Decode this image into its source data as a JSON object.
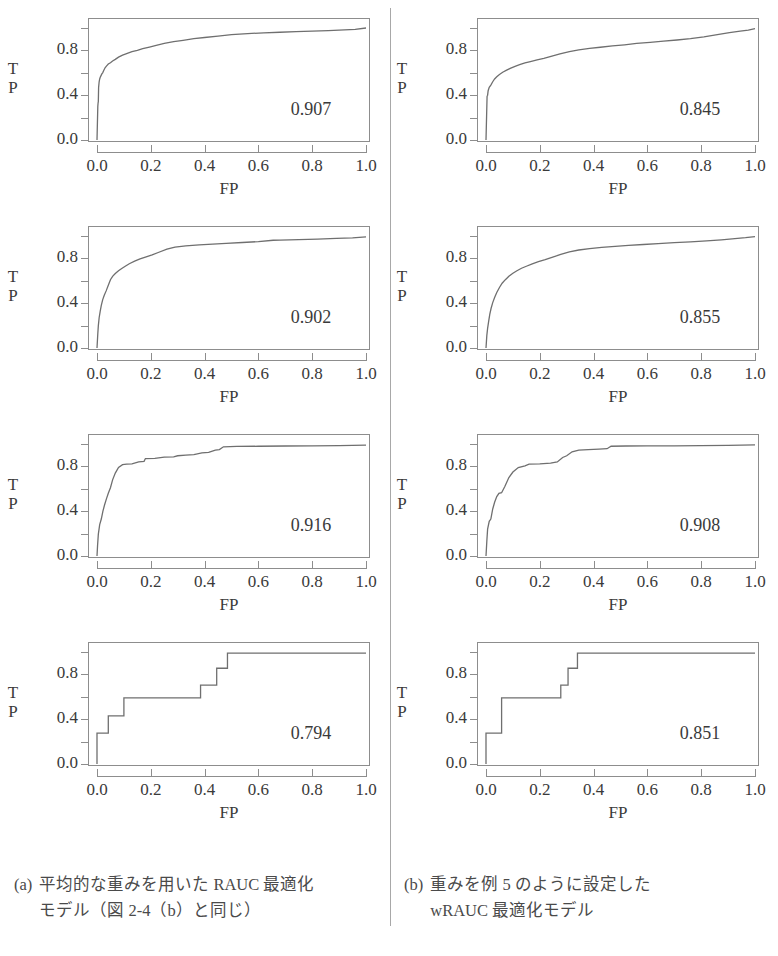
{
  "figure": {
    "axis_labels": {
      "y": [
        "T",
        "P"
      ],
      "x": "FP"
    },
    "y_ticks": [
      "0.0",
      "0.4",
      "0.8"
    ],
    "x_ticks": [
      "0.0",
      "0.2",
      "0.4",
      "0.6",
      "0.8",
      "1.0"
    ],
    "line_color": "#6f6f6f",
    "box_color": "#8d8d8d",
    "text_color": "#3a3a3a"
  },
  "panels": [
    {
      "id": "panel-a1",
      "column": "a",
      "row": 1,
      "auc": "0.907"
    },
    {
      "id": "panel-b1",
      "column": "b",
      "row": 1,
      "auc": "0.845"
    },
    {
      "id": "panel-a2",
      "column": "a",
      "row": 2,
      "auc": "0.902"
    },
    {
      "id": "panel-b2",
      "column": "b",
      "row": 2,
      "auc": "0.855"
    },
    {
      "id": "panel-a3",
      "column": "a",
      "row": 3,
      "auc": "0.916"
    },
    {
      "id": "panel-b3",
      "column": "b",
      "row": 3,
      "auc": "0.908"
    },
    {
      "id": "panel-a4",
      "column": "a",
      "row": 4,
      "auc": "0.794"
    },
    {
      "id": "panel-b4",
      "column": "b",
      "row": 4,
      "auc": "0.851"
    }
  ],
  "captions": {
    "a": {
      "tag": "(a)",
      "line1": "平均的な重みを用いた RAUC 最適化",
      "line2": "モデル（図 2-4（b）と同じ）"
    },
    "b": {
      "tag": "(b)",
      "line1": "重みを例 5 のように設定した",
      "line2": "wRAUC 最適化モデル"
    }
  },
  "chart_data": [
    {
      "type": "line",
      "title": "ROC curve (a) row 1",
      "xlabel": "FP",
      "ylabel": "TP",
      "xlim": [
        0,
        1
      ],
      "ylim": [
        0,
        1
      ],
      "xticks": [
        0.0,
        0.2,
        0.4,
        0.6,
        0.8,
        1.0
      ],
      "yticks": [
        0.0,
        0.4,
        0.8
      ],
      "grid": false,
      "annotations": [
        {
          "text": "0.907",
          "x": 0.78,
          "y": 0.22
        }
      ],
      "x": [
        0.0,
        0.003,
        0.004,
        0.005,
        0.006,
        0.008,
        0.01,
        0.012,
        0.015,
        0.018,
        0.021,
        0.025,
        0.03,
        0.035,
        0.042,
        0.05,
        0.058,
        0.068,
        0.08,
        0.095,
        0.11,
        0.13,
        0.15,
        0.17,
        0.195,
        0.22,
        0.25,
        0.285,
        0.32,
        0.36,
        0.4,
        0.45,
        0.5,
        0.56,
        0.62,
        0.68,
        0.74,
        0.8,
        0.86,
        0.92,
        0.96,
        1.0
      ],
      "y": [
        0.0,
        0.3,
        0.33,
        0.345,
        0.47,
        0.52,
        0.545,
        0.56,
        0.575,
        0.59,
        0.6,
        0.62,
        0.645,
        0.66,
        0.678,
        0.69,
        0.705,
        0.72,
        0.74,
        0.758,
        0.772,
        0.788,
        0.8,
        0.815,
        0.83,
        0.845,
        0.862,
        0.878,
        0.89,
        0.905,
        0.915,
        0.928,
        0.94,
        0.95,
        0.957,
        0.962,
        0.968,
        0.972,
        0.977,
        0.983,
        0.988,
        1.0
      ]
    },
    {
      "type": "line",
      "title": "ROC curve (b) row 1",
      "xlabel": "FP",
      "ylabel": "TP",
      "xlim": [
        0,
        1
      ],
      "ylim": [
        0,
        1
      ],
      "xticks": [
        0.0,
        0.2,
        0.4,
        0.6,
        0.8,
        1.0
      ],
      "yticks": [
        0.0,
        0.4,
        0.8
      ],
      "grid": false,
      "annotations": [
        {
          "text": "0.845",
          "x": 0.78,
          "y": 0.22
        }
      ],
      "x": [
        0.0,
        0.004,
        0.006,
        0.008,
        0.012,
        0.018,
        0.025,
        0.032,
        0.04,
        0.05,
        0.062,
        0.075,
        0.09,
        0.108,
        0.125,
        0.145,
        0.165,
        0.19,
        0.215,
        0.245,
        0.275,
        0.31,
        0.345,
        0.385,
        0.425,
        0.47,
        0.515,
        0.56,
        0.61,
        0.66,
        0.71,
        0.76,
        0.81,
        0.86,
        0.905,
        0.945,
        0.975,
        1.0
      ],
      "y": [
        0.0,
        0.39,
        0.4,
        0.44,
        0.47,
        0.49,
        0.52,
        0.545,
        0.565,
        0.585,
        0.605,
        0.622,
        0.64,
        0.658,
        0.672,
        0.688,
        0.7,
        0.715,
        0.728,
        0.748,
        0.768,
        0.79,
        0.805,
        0.818,
        0.828,
        0.84,
        0.85,
        0.862,
        0.872,
        0.882,
        0.893,
        0.905,
        0.92,
        0.94,
        0.958,
        0.972,
        0.982,
        0.995
      ]
    },
    {
      "type": "line",
      "title": "ROC curve (a) row 2",
      "xlabel": "FP",
      "ylabel": "TP",
      "xlim": [
        0,
        1
      ],
      "ylim": [
        0,
        1
      ],
      "xticks": [
        0.0,
        0.2,
        0.4,
        0.6,
        0.8,
        1.0
      ],
      "yticks": [
        0.0,
        0.4,
        0.8
      ],
      "grid": false,
      "annotations": [
        {
          "text": "0.902",
          "x": 0.78,
          "y": 0.22
        }
      ],
      "x": [
        0.0,
        0.003,
        0.005,
        0.008,
        0.012,
        0.016,
        0.021,
        0.027,
        0.034,
        0.042,
        0.05,
        0.058,
        0.068,
        0.08,
        0.092,
        0.105,
        0.12,
        0.14,
        0.16,
        0.18,
        0.205,
        0.23,
        0.26,
        0.29,
        0.33,
        0.38,
        0.43,
        0.48,
        0.54,
        0.6,
        0.655,
        0.68,
        0.75,
        0.82,
        0.89,
        0.95,
        1.0
      ],
      "y": [
        0.0,
        0.13,
        0.2,
        0.27,
        0.33,
        0.38,
        0.43,
        0.47,
        0.51,
        0.56,
        0.61,
        0.64,
        0.665,
        0.69,
        0.71,
        0.73,
        0.752,
        0.775,
        0.795,
        0.812,
        0.832,
        0.855,
        0.882,
        0.9,
        0.912,
        0.92,
        0.928,
        0.934,
        0.942,
        0.95,
        0.962,
        0.964,
        0.968,
        0.972,
        0.978,
        0.984,
        0.992
      ]
    },
    {
      "type": "line",
      "title": "ROC curve (b) row 2",
      "xlabel": "FP",
      "ylabel": "TP",
      "xlim": [
        0,
        1
      ],
      "ylim": [
        0,
        1
      ],
      "xticks": [
        0.0,
        0.2,
        0.4,
        0.6,
        0.8,
        1.0
      ],
      "yticks": [
        0.0,
        0.4,
        0.8
      ],
      "grid": false,
      "annotations": [
        {
          "text": "0.855",
          "x": 0.78,
          "y": 0.22
        }
      ],
      "x": [
        0.0,
        0.003,
        0.006,
        0.01,
        0.014,
        0.019,
        0.025,
        0.032,
        0.04,
        0.05,
        0.06,
        0.072,
        0.085,
        0.1,
        0.115,
        0.132,
        0.15,
        0.172,
        0.195,
        0.22,
        0.248,
        0.278,
        0.31,
        0.345,
        0.385,
        0.43,
        0.48,
        0.53,
        0.585,
        0.64,
        0.7,
        0.76,
        0.82,
        0.875,
        0.925,
        0.965,
        1.0
      ],
      "y": [
        0.0,
        0.11,
        0.175,
        0.24,
        0.3,
        0.355,
        0.405,
        0.45,
        0.495,
        0.54,
        0.578,
        0.61,
        0.64,
        0.668,
        0.69,
        0.712,
        0.73,
        0.752,
        0.772,
        0.79,
        0.812,
        0.835,
        0.858,
        0.875,
        0.888,
        0.898,
        0.908,
        0.916,
        0.924,
        0.932,
        0.94,
        0.948,
        0.956,
        0.966,
        0.976,
        0.985,
        0.995
      ]
    },
    {
      "type": "line",
      "title": "ROC curve (a) row 3",
      "xlabel": "FP",
      "ylabel": "TP",
      "xlim": [
        0,
        1
      ],
      "ylim": [
        0,
        1
      ],
      "xticks": [
        0.0,
        0.2,
        0.4,
        0.6,
        0.8,
        1.0
      ],
      "yticks": [
        0.0,
        0.4,
        0.8
      ],
      "grid": false,
      "annotations": [
        {
          "text": "0.916",
          "x": 0.78,
          "y": 0.22
        }
      ],
      "x": [
        0.0,
        0.002,
        0.005,
        0.01,
        0.016,
        0.022,
        0.028,
        0.035,
        0.042,
        0.05,
        0.058,
        0.068,
        0.08,
        0.095,
        0.11,
        0.13,
        0.155,
        0.175,
        0.18,
        0.215,
        0.25,
        0.285,
        0.3,
        0.33,
        0.36,
        0.39,
        0.415,
        0.44,
        0.455,
        0.47,
        0.52,
        0.6,
        0.7,
        0.8,
        0.9,
        1.0
      ],
      "y": [
        0.0,
        0.09,
        0.195,
        0.28,
        0.33,
        0.4,
        0.455,
        0.51,
        0.56,
        0.61,
        0.68,
        0.74,
        0.79,
        0.815,
        0.82,
        0.822,
        0.84,
        0.845,
        0.87,
        0.872,
        0.882,
        0.885,
        0.895,
        0.9,
        0.905,
        0.92,
        0.925,
        0.945,
        0.95,
        0.975,
        0.978,
        0.98,
        0.982,
        0.984,
        0.986,
        0.99
      ]
    },
    {
      "type": "line",
      "title": "ROC curve (b) row 3",
      "xlabel": "FP",
      "ylabel": "TP",
      "xlim": [
        0,
        1
      ],
      "ylim": [
        0,
        1
      ],
      "xticks": [
        0.0,
        0.2,
        0.4,
        0.6,
        0.8,
        1.0
      ],
      "yticks": [
        0.0,
        0.4,
        0.8
      ],
      "grid": false,
      "annotations": [
        {
          "text": "0.908",
          "x": 0.78,
          "y": 0.22
        }
      ],
      "x": [
        0.0,
        0.003,
        0.006,
        0.012,
        0.018,
        0.025,
        0.032,
        0.04,
        0.048,
        0.058,
        0.07,
        0.085,
        0.1,
        0.12,
        0.145,
        0.16,
        0.2,
        0.24,
        0.265,
        0.285,
        0.3,
        0.32,
        0.345,
        0.38,
        0.42,
        0.45,
        0.465,
        0.52,
        0.6,
        0.7,
        0.8,
        0.9,
        1.0
      ],
      "y": [
        0.0,
        0.13,
        0.24,
        0.31,
        0.33,
        0.42,
        0.48,
        0.53,
        0.56,
        0.565,
        0.62,
        0.7,
        0.75,
        0.79,
        0.805,
        0.82,
        0.822,
        0.83,
        0.84,
        0.88,
        0.895,
        0.93,
        0.945,
        0.95,
        0.955,
        0.958,
        0.98,
        0.982,
        0.983,
        0.984,
        0.986,
        0.988,
        0.992
      ]
    },
    {
      "type": "line",
      "title": "ROC curve (a) row 4",
      "xlabel": "FP",
      "ylabel": "TP",
      "xlim": [
        0,
        1
      ],
      "ylim": [
        0,
        1
      ],
      "xticks": [
        0.0,
        0.2,
        0.4,
        0.6,
        0.8,
        1.0
      ],
      "yticks": [
        0.0,
        0.4,
        0.8
      ],
      "grid": false,
      "step": true,
      "annotations": [
        {
          "text": "0.794",
          "x": 0.78,
          "y": 0.22
        }
      ],
      "x": [
        0.0,
        0.0,
        0.042,
        0.042,
        0.1,
        0.1,
        0.385,
        0.385,
        0.445,
        0.445,
        0.485,
        0.485,
        1.0
      ],
      "y": [
        0.0,
        0.275,
        0.275,
        0.43,
        0.43,
        0.59,
        0.59,
        0.705,
        0.705,
        0.855,
        0.855,
        0.99,
        0.99
      ]
    },
    {
      "type": "line",
      "title": "ROC curve (b) row 4",
      "xlabel": "FP",
      "ylabel": "TP",
      "xlim": [
        0,
        1
      ],
      "ylim": [
        0,
        1
      ],
      "xticks": [
        0.0,
        0.2,
        0.4,
        0.6,
        0.8,
        1.0
      ],
      "yticks": [
        0.0,
        0.4,
        0.8
      ],
      "grid": false,
      "step": true,
      "annotations": [
        {
          "text": "0.851",
          "x": 0.78,
          "y": 0.22
        }
      ],
      "x": [
        0.0,
        0.0,
        0.058,
        0.058,
        0.278,
        0.278,
        0.305,
        0.305,
        0.34,
        0.34,
        1.0
      ],
      "y": [
        0.0,
        0.275,
        0.275,
        0.59,
        0.59,
        0.705,
        0.705,
        0.855,
        0.855,
        0.99,
        0.99
      ]
    }
  ]
}
